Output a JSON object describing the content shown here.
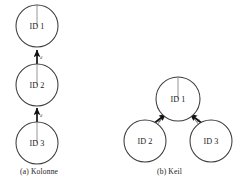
{
  "figure": {
    "background_color": "#ffffff",
    "stroke_color": "#3c3c3c",
    "arrow_color": "#111111",
    "guide_color": "#8a8a8a"
  },
  "panels": [
    {
      "key": "kolonne",
      "caption": "(a) Kolonne",
      "nodes": [
        {
          "label": "ID 1",
          "cx": 37,
          "cy": 26,
          "r": 21,
          "heading_deg": 90
        },
        {
          "label": "ID 2",
          "cx": 37,
          "cy": 85,
          "r": 21,
          "heading_deg": 90
        },
        {
          "label": "ID 3",
          "cx": 37,
          "cy": 143,
          "r": 21,
          "heading_deg": 90
        }
      ],
      "links": [
        {
          "from": "ID 2",
          "to": "ID 1",
          "distance_label": "d",
          "angle_label": ""
        },
        {
          "from": "ID 3",
          "to": "ID 2",
          "distance_label": "d",
          "angle_label": ""
        }
      ]
    },
    {
      "key": "keil",
      "caption": "(b) Keil",
      "nodes": [
        {
          "label": "ID 1",
          "cx": 178,
          "cy": 99,
          "r": 22,
          "heading_deg": 90
        },
        {
          "label": "ID 2",
          "cx": 145,
          "cy": 141,
          "r": 21,
          "heading_deg": 90
        },
        {
          "label": "ID 3",
          "cx": 211,
          "cy": 141,
          "r": 21,
          "heading_deg": 90
        }
      ],
      "links": [
        {
          "from": "ID 2",
          "to": "ID 1",
          "distance_label": "d",
          "angle_label": "α"
        },
        {
          "from": "ID 3",
          "to": "ID 1",
          "distance_label": "d",
          "angle_label": "α"
        }
      ]
    }
  ]
}
